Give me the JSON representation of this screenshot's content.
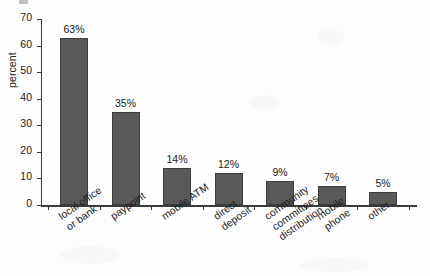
{
  "chart_data": {
    "type": "bar",
    "title": "",
    "subtitle": "",
    "xlabel": "",
    "ylabel": "percent",
    "ylim": [
      0,
      70
    ],
    "y_ticks": [
      0,
      10,
      20,
      30,
      40,
      50,
      60,
      70
    ],
    "y_tick_labels": [
      "0",
      "10",
      "20",
      "30",
      "40",
      "50",
      "60",
      "70"
    ],
    "grid": false,
    "legend": false,
    "legend_position": "none",
    "categories": [
      "local office or bank",
      "paypoint",
      "mobile ATM",
      "direct deposit",
      "community committees distribution",
      "mobile phone",
      "other"
    ],
    "category_label_lines": [
      [
        "local office",
        "or bank"
      ],
      [
        "paypoint"
      ],
      [
        "mobile ATM"
      ],
      [
        "direct",
        "deposit"
      ],
      [
        "community",
        "committees",
        "distribution"
      ],
      [
        "mobile",
        "phone"
      ],
      [
        "other"
      ]
    ],
    "values": [
      63,
      35,
      14,
      12,
      9,
      7,
      5
    ],
    "value_labels": [
      "63%",
      "35%",
      "14%",
      "12%",
      "9%",
      "7%",
      "5%"
    ],
    "series": [
      {
        "name": "percent",
        "values": [
          63,
          35,
          14,
          12,
          9,
          7,
          5
        ]
      }
    ],
    "colors": {
      "bar_fill": "#595959",
      "bar_stroke": "#3d3d3d",
      "axis": "#3a3a3a",
      "text": "#1b1b1b",
      "background": "#fdfdfd"
    }
  }
}
